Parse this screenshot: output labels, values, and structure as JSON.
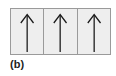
{
  "figure": {
    "label": "(b)",
    "cells": [
      {
        "arrow": "up-arrow-icon",
        "direction": "up"
      },
      {
        "arrow": "up-arrow-icon",
        "direction": "up"
      },
      {
        "arrow": "up-arrow-icon",
        "direction": "up"
      }
    ],
    "colors": {
      "cell_background": "#eeeeee",
      "border": "#9a9a9a",
      "arrow": "#1a1a1a",
      "label": "#222222"
    }
  }
}
